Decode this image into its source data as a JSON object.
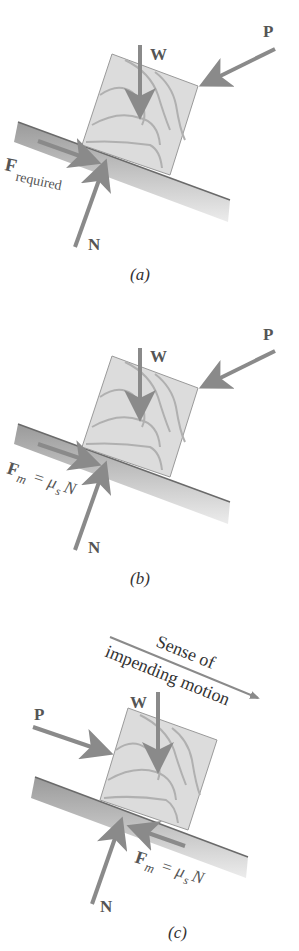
{
  "figure": {
    "colors": {
      "arrow": "#8a8a8a",
      "block_fill": "#dcdcdc",
      "block_grain": "#b0b0b0",
      "incline_top": "#9a9a9a",
      "incline_bottom": "#ececec",
      "incline_edge": "#6a6a6a",
      "text": "#555555"
    }
  },
  "panels": [
    {
      "id": "a",
      "caption": "(a)",
      "labels": {
        "weight": "W",
        "push": "P",
        "normal": "N",
        "friction_main": "F",
        "friction_sub": "required"
      }
    },
    {
      "id": "b",
      "caption": "(b)",
      "labels": {
        "weight": "W",
        "push": "P",
        "normal": "N",
        "friction_main": "F",
        "friction_sub": "m",
        "friction_eq": "= μ",
        "friction_eq_sub": "s",
        "friction_eq_end": "N"
      }
    },
    {
      "id": "c",
      "caption": "(c)",
      "labels": {
        "weight": "W",
        "push": "P",
        "normal": "N",
        "friction_main": "F",
        "friction_sub": "m",
        "friction_eq": "= μ",
        "friction_eq_sub": "s",
        "friction_eq_end": "N",
        "motion_line1": "Sense of",
        "motion_line2": "impending motion"
      }
    }
  ]
}
